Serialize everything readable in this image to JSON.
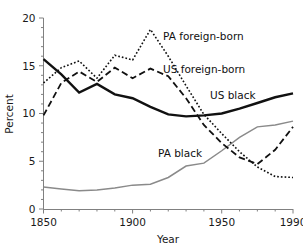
{
  "chart_data": {
    "type": "line",
    "title": "",
    "xlabel": "Year",
    "ylabel": "Percent",
    "xlim": [
      1850,
      1990
    ],
    "ylim": [
      0,
      20
    ],
    "xticks": [
      1850,
      1900,
      1950,
      1990
    ],
    "xtick_labels": [
      "1850",
      "1900",
      "1950",
      "1990"
    ],
    "xminor_step": 10,
    "yticks": [
      0,
      5,
      10,
      15,
      20
    ],
    "ytick_labels": [
      "0",
      "5",
      "10",
      "15",
      "20"
    ],
    "yminor_step": 1,
    "grid": false,
    "legend": "inline-annotations",
    "x": [
      1850,
      1860,
      1870,
      1880,
      1890,
      1900,
      1910,
      1920,
      1930,
      1940,
      1950,
      1960,
      1970,
      1980,
      1990
    ],
    "series": [
      {
        "name": "PA foreign-born",
        "style": "dotted",
        "color": "#111111",
        "width": 1.6,
        "values": [
          13.2,
          14.8,
          15.5,
          13.7,
          16.1,
          15.6,
          18.8,
          16.0,
          12.9,
          9.9,
          7.9,
          6.0,
          4.4,
          3.4,
          3.3
        ]
      },
      {
        "name": "US foreign-born",
        "style": "dashed",
        "color": "#111111",
        "width": 1.8,
        "values": [
          9.8,
          13.2,
          14.4,
          13.3,
          14.8,
          13.7,
          14.7,
          13.9,
          11.6,
          8.8,
          6.9,
          5.4,
          4.7,
          6.2,
          8.6
        ]
      },
      {
        "name": "US black",
        "style": "solid",
        "color": "#111111",
        "width": 2.4,
        "values": [
          15.7,
          14.1,
          12.2,
          13.1,
          12.0,
          11.6,
          10.7,
          9.9,
          9.7,
          9.8,
          10.0,
          10.5,
          11.1,
          11.7,
          12.1
        ]
      },
      {
        "name": "PA black",
        "style": "solid",
        "color": "#8a8a8a",
        "width": 1.5,
        "values": [
          2.3,
          2.1,
          1.9,
          2.0,
          2.2,
          2.5,
          2.6,
          3.3,
          4.5,
          4.8,
          6.1,
          7.5,
          8.6,
          8.8,
          9.2
        ]
      }
    ],
    "annotations": [
      {
        "text": "PA foreign-born",
        "x_px": 163,
        "y_px": 40
      },
      {
        "text": "US foreign-born",
        "x_px": 163,
        "y_px": 73
      },
      {
        "text": "US black",
        "x_px": 210,
        "y_px": 99
      },
      {
        "text": "PA black",
        "x_px": 158,
        "y_px": 157
      }
    ]
  }
}
